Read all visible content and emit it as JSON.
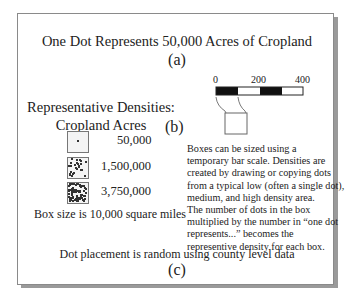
{
  "title": "One Dot Represents 50,000 Acres of Cropland",
  "labels": {
    "a": "(a)",
    "b": "(b)",
    "c": "(c)"
  },
  "legend": {
    "heading_line1": "Representative Densities:",
    "heading_line2": "Cropland Acres",
    "boxes": [
      {
        "name": "low",
        "value": "50,000",
        "dots": 1
      },
      {
        "name": "medium",
        "value": "1,500,000",
        "dots": 30
      },
      {
        "name": "high",
        "value": "3,750,000",
        "dots": 75
      }
    ],
    "box_size_note": "Box size is 10,000 square miles"
  },
  "scale_bar": {
    "ticks": [
      "0",
      "200",
      "400"
    ],
    "colors": {
      "dark": "#111111",
      "light": "#ffffff"
    }
  },
  "description": [
    "Boxes can be sized using a",
    "temporary bar scale. Densities are",
    "created by drawing or copying dots",
    "from a typical low (often a single dot),",
    "medium, and high density area.",
    "The number of dots in the box",
    "multiplied by the number in “one dot",
    "represents...” becomes the",
    "representive density for each box."
  ],
  "footer": "Dot placement is random using county level data"
}
